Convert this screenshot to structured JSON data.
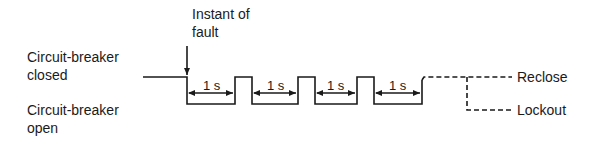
{
  "diagram": {
    "labels": {
      "fault": [
        "Instant of",
        "fault"
      ],
      "closed": [
        "Circuit-breaker",
        "closed"
      ],
      "open": [
        "Circuit-breaker",
        "open"
      ],
      "reclose": "Reclose",
      "lockout": "Lockout"
    },
    "intervals": [
      "1 s",
      "1 s",
      "1 s",
      "1 s"
    ],
    "colors": {
      "line": "#1a1a1a",
      "background": "#ffffff"
    }
  }
}
